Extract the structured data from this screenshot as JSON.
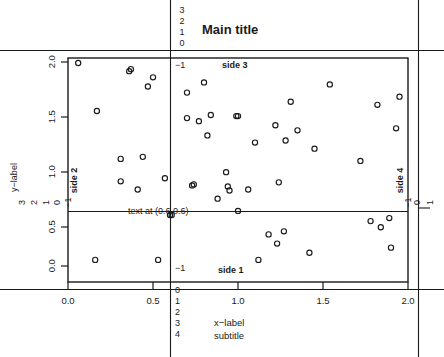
{
  "figure": {
    "title": "Main title",
    "subtitle": "subtitle",
    "xlabel": "x−label",
    "ylabel": "y−label",
    "annotation": "text at (0.6,0.6)",
    "side_labels": {
      "side1": "side 1",
      "side2": "side 2",
      "side3": "side 3",
      "side4": "side 4"
    },
    "inner_margin_label": "−1",
    "background": "#ffffff",
    "foreground": "#1a1a1a"
  },
  "axes": {
    "x_ticks": [
      "0.0",
      "0.5",
      "1.0",
      "1.5",
      "2.0"
    ],
    "y_ticks": [
      "0.0",
      "0.5",
      "1.0",
      "1.5",
      "2.0"
    ],
    "x_margin_lines": [
      "0",
      "1",
      "2",
      "3",
      "4"
    ],
    "y_margin_lines": [
      "3",
      "2",
      "1",
      "0"
    ],
    "top_margin_lines": [
      "3",
      "2",
      "1",
      "0"
    ],
    "right_margin_lines": [
      "0",
      "1"
    ]
  },
  "chart_data": {
    "type": "scatter",
    "title": "Main title",
    "subtitle": "subtitle",
    "xlabel": "x−label",
    "ylabel": "y−label",
    "xlim": [
      0.0,
      2.0
    ],
    "ylim": [
      0.0,
      2.0
    ],
    "xticks": [
      0.0,
      0.5,
      1.0,
      1.5,
      2.0
    ],
    "yticks": [
      0.0,
      0.5,
      1.0,
      1.5,
      2.0
    ],
    "grid": false,
    "legend": "none",
    "marker": "open-circle",
    "annotations": [
      {
        "text": "text at (0.6,0.6)",
        "x": 0.6,
        "y": 0.6
      },
      {
        "text": "side 1",
        "side": 1
      },
      {
        "text": "side 2",
        "side": 2
      },
      {
        "text": "side 3",
        "side": 3
      },
      {
        "text": "side 4",
        "side": 4
      }
    ],
    "reference_lines": [
      {
        "orientation": "vertical",
        "x": 0.6
      },
      {
        "orientation": "horizontal",
        "y": 0.6
      }
    ],
    "points": [
      {
        "x": 0.06,
        "y": 1.99
      },
      {
        "x": 0.36,
        "y": 1.91
      },
      {
        "x": 0.37,
        "y": 1.93
      },
      {
        "x": 0.5,
        "y": 1.85
      },
      {
        "x": 0.47,
        "y": 1.76
      },
      {
        "x": 0.17,
        "y": 1.52
      },
      {
        "x": 0.31,
        "y": 1.05
      },
      {
        "x": 0.44,
        "y": 1.07
      },
      {
        "x": 0.31,
        "y": 0.83
      },
      {
        "x": 0.41,
        "y": 0.75
      },
      {
        "x": 0.57,
        "y": 0.86
      },
      {
        "x": 0.6,
        "y": 0.5
      },
      {
        "x": 0.61,
        "y": 0.5
      },
      {
        "x": 0.16,
        "y": 0.06
      },
      {
        "x": 0.53,
        "y": 0.06
      },
      {
        "x": 0.8,
        "y": 1.8
      },
      {
        "x": 0.7,
        "y": 1.7
      },
      {
        "x": 0.7,
        "y": 1.45
      },
      {
        "x": 0.77,
        "y": 1.42
      },
      {
        "x": 0.84,
        "y": 1.48
      },
      {
        "x": 0.99,
        "y": 1.47
      },
      {
        "x": 1.0,
        "y": 1.47
      },
      {
        "x": 0.82,
        "y": 1.28
      },
      {
        "x": 1.1,
        "y": 1.21
      },
      {
        "x": 0.93,
        "y": 0.92
      },
      {
        "x": 0.94,
        "y": 0.78
      },
      {
        "x": 0.95,
        "y": 0.74
      },
      {
        "x": 0.88,
        "y": 0.66
      },
      {
        "x": 1.06,
        "y": 0.75
      },
      {
        "x": 0.73,
        "y": 0.79
      },
      {
        "x": 0.74,
        "y": 0.8
      },
      {
        "x": 1.31,
        "y": 1.61
      },
      {
        "x": 1.22,
        "y": 1.38
      },
      {
        "x": 1.35,
        "y": 1.33
      },
      {
        "x": 1.28,
        "y": 1.23
      },
      {
        "x": 1.45,
        "y": 1.15
      },
      {
        "x": 1.24,
        "y": 0.82
      },
      {
        "x": 1.54,
        "y": 1.78
      },
      {
        "x": 1.82,
        "y": 1.58
      },
      {
        "x": 1.95,
        "y": 1.66
      },
      {
        "x": 1.93,
        "y": 1.35
      },
      {
        "x": 1.72,
        "y": 1.03
      },
      {
        "x": 1.0,
        "y": 0.54
      },
      {
        "x": 1.18,
        "y": 0.31
      },
      {
        "x": 1.27,
        "y": 0.34
      },
      {
        "x": 1.23,
        "y": 0.22
      },
      {
        "x": 1.12,
        "y": 0.06
      },
      {
        "x": 1.42,
        "y": 0.13
      },
      {
        "x": 1.78,
        "y": 0.44
      },
      {
        "x": 1.89,
        "y": 0.47
      },
      {
        "x": 1.84,
        "y": 0.38
      },
      {
        "x": 1.9,
        "y": 0.18
      }
    ]
  }
}
